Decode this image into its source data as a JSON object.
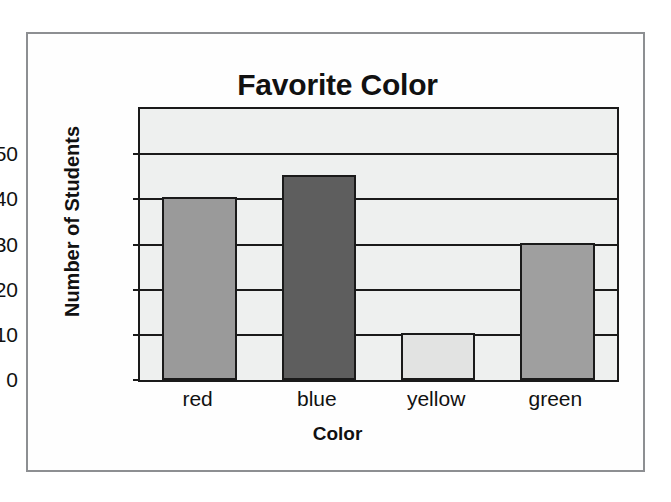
{
  "figure": {
    "background_color": "#fefefe",
    "frame_color": "#8d8f92"
  },
  "chart_data": {
    "type": "bar",
    "title": "Favorite Color",
    "xlabel": "Color",
    "ylabel": "Number of Students",
    "categories": [
      "red",
      "blue",
      "yellow",
      "green"
    ],
    "values": [
      40,
      45,
      10,
      30
    ],
    "bar_colors": [
      "#9a9a9a",
      "#5e5e5e",
      "#e2e3e2",
      "#9f9f9f"
    ],
    "bar_edge_color": "#1a1a1a",
    "plot_background": "#eef0ef",
    "ylim": [
      0,
      60
    ],
    "ytick_labels": [
      "0",
      "10",
      "20",
      "30",
      "40",
      "50"
    ],
    "ytick_values": [
      0,
      10,
      20,
      30,
      40,
      50
    ],
    "grid": true,
    "grid_axis": "y",
    "legend": false,
    "legend_position": "none"
  }
}
